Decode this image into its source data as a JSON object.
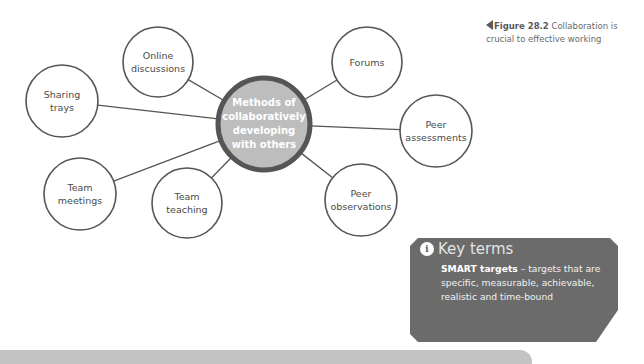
{
  "diagram": {
    "center": {
      "label": "Methods of\ncollaboratively\ndeveloping\nwith others",
      "cx": 264,
      "cy": 124,
      "r": 46,
      "fill": "#bdbdbd",
      "stroke": "#555555"
    },
    "nodes": [
      {
        "id": "online-discussions",
        "label": "Online\ndiscussions",
        "cx": 158,
        "cy": 62,
        "r": 35
      },
      {
        "id": "forums",
        "label": "Forums",
        "cx": 367,
        "cy": 62,
        "r": 35
      },
      {
        "id": "sharing-trays",
        "label": "Sharing\ntrays",
        "cx": 62,
        "cy": 101,
        "r": 36
      },
      {
        "id": "peer-assessments",
        "label": "Peer\nassessments",
        "cx": 436,
        "cy": 131,
        "r": 36
      },
      {
        "id": "team-meetings",
        "label": "Team\nmeetings",
        "cx": 80,
        "cy": 194,
        "r": 36
      },
      {
        "id": "team-teaching",
        "label": "Team\nteaching",
        "cx": 187,
        "cy": 203,
        "r": 35
      },
      {
        "id": "peer-observations",
        "label": "Peer\nobservations",
        "cx": 361,
        "cy": 200,
        "r": 36
      }
    ],
    "node_stroke": "#555555",
    "line_color": "#555555"
  },
  "caption": {
    "figure": "Figure 28.2",
    "text": " Collaboration is crucial to effective working"
  },
  "key_terms": {
    "heading": "Key terms",
    "icon": "info-icon",
    "term": "SMART targets",
    "definition": " – targets that are specific, measurable, achievable, realistic and time-bound",
    "bg": "#6b6b6b"
  }
}
